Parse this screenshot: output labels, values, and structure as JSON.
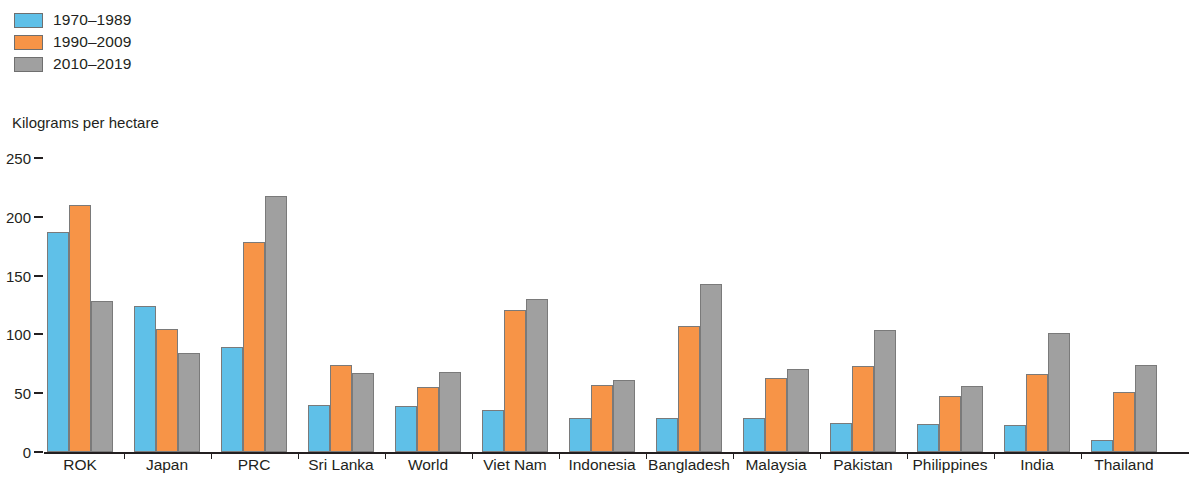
{
  "legend": {
    "items": [
      {
        "label": "1970–1989",
        "color": "#5fc0e8",
        "name": "legend-item-1970-1989"
      },
      {
        "label": "1990–2009",
        "color": "#f79447",
        "name": "legend-item-1990-2009"
      },
      {
        "label": "2010–2019",
        "color": "#a0a0a0",
        "name": "legend-item-2010-2019"
      }
    ]
  },
  "axis": {
    "unit_caption": "Kilograms per hectare",
    "yticks": [
      "0",
      "50",
      "100",
      "150",
      "200",
      "250"
    ]
  },
  "chart_data": {
    "type": "bar",
    "title": "",
    "subtitle": "",
    "xlabel": "",
    "ylabel": "Kilograms per hectare",
    "ylim": [
      0,
      250
    ],
    "yticks": [
      0,
      50,
      100,
      150,
      200,
      250
    ],
    "grid": false,
    "legend_position": "top-left",
    "categories": [
      "ROK",
      "Japan",
      "PRC",
      "Sri Lanka",
      "World",
      "Viet Nam",
      "Indonesia",
      "Bangladesh",
      "Malaysia",
      "Pakistan",
      "Philippines",
      "India",
      "Thailand"
    ],
    "series": [
      {
        "name": "1970–1989",
        "color": "#5fc0e8",
        "values": [
          187,
          124,
          89,
          40,
          39,
          36,
          29,
          29,
          29,
          25,
          24,
          23,
          10
        ]
      },
      {
        "name": "1990–2009",
        "color": "#f79447",
        "values": [
          210,
          105,
          179,
          74,
          55,
          121,
          57,
          107,
          63,
          73,
          48,
          66,
          51
        ]
      },
      {
        "name": "2010–2019",
        "color": "#a0a0a0",
        "values": [
          128,
          84,
          218,
          67,
          68,
          130,
          61,
          143,
          71,
          104,
          56,
          101,
          74
        ]
      }
    ]
  }
}
